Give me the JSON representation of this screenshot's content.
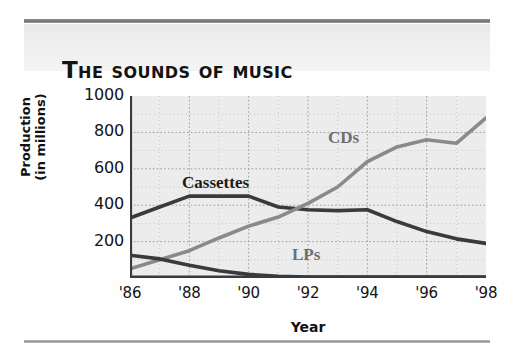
{
  "figure": {
    "title": "The Sounds of Music"
  },
  "chart_data": {
    "type": "line",
    "title": "The Sounds of Music",
    "xlabel": "Year",
    "ylabel": "Production\n(in millions)",
    "x": [
      1986,
      1987,
      1988,
      1989,
      1990,
      1991,
      1992,
      1993,
      1994,
      1995,
      1996,
      1997,
      1998
    ],
    "xtick_labels": [
      "'86",
      "'88",
      "'90",
      "'92",
      "'94",
      "'96",
      "'98"
    ],
    "xtick_values": [
      1986,
      1988,
      1990,
      1992,
      1994,
      1996,
      1998
    ],
    "ytick_labels": [
      "200",
      "400",
      "600",
      "800",
      "1000"
    ],
    "ytick_values": [
      200,
      400,
      600,
      800,
      1000
    ],
    "xlim": [
      1986,
      1998
    ],
    "ylim": [
      0,
      1000
    ],
    "grid": true,
    "legend": "inline-labels",
    "series": [
      {
        "name": "Cassettes",
        "color": "#3a3a3a",
        "label_position": "inline",
        "values": [
          330,
          390,
          450,
          450,
          450,
          390,
          375,
          370,
          375,
          310,
          255,
          215,
          190
        ]
      },
      {
        "name": "CDs",
        "color": "#8a8a8a",
        "label_position": "inline",
        "values": [
          50,
          100,
          150,
          220,
          285,
          335,
          410,
          500,
          640,
          720,
          760,
          740,
          880
        ]
      },
      {
        "name": "LPs",
        "color": "#3a3a3a",
        "label_position": "inline",
        "values": [
          125,
          105,
          70,
          40,
          20,
          10,
          5,
          5,
          5,
          5,
          5,
          5,
          5
        ]
      }
    ]
  }
}
